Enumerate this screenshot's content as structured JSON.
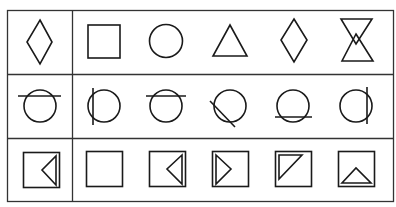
{
  "puzzle": {
    "description": "Figure reasoning puzzle: 3 rows, each with a reference figure on the left and five candidate figures on the right",
    "colors": {
      "line": "#1a1a1a",
      "background": "#ffffff"
    },
    "rows": [
      {
        "reference": "diamond",
        "figures": [
          "square",
          "circle",
          "triangle",
          "diamond",
          "hourglass-two-triangles"
        ]
      },
      {
        "reference": "circle-with-horizontal-line-near-top",
        "figures": [
          "circle-with-vertical-line-left",
          "circle-with-horizontal-line-near-top",
          "circle-with-diagonal-line-lower-left",
          "circle-with-horizontal-line-near-bottom",
          "circle-with-vertical-line-right"
        ]
      },
      {
        "reference": "square-with-left-pointing-triangle-on-right-edge",
        "figures": [
          "empty-square",
          "square-with-left-pointing-triangle-on-right-edge",
          "square-with-right-pointing-triangle-on-left-edge",
          "square-with-triangle-in-top-left-corner",
          "square-with-upward-triangle-on-bottom-edge"
        ]
      }
    ]
  }
}
